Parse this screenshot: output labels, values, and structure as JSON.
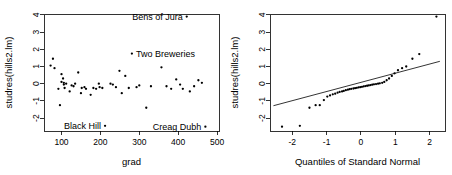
{
  "figure": {
    "background_color": "#ffffff",
    "point_color": "#000000",
    "line_color": "#000000"
  },
  "chart_data": [
    {
      "type": "scatter",
      "panel": "left",
      "title": "",
      "xlabel": "grad",
      "ylabel": "studres(hills2.lm)",
      "xlim": [
        55,
        505
      ],
      "ylim": [
        -2.75,
        4.05
      ],
      "xticks": [
        100,
        200,
        300,
        400,
        500
      ],
      "yticks": [
        -2,
        -1,
        0,
        1,
        2,
        3,
        4
      ],
      "grid": false,
      "legend": "none",
      "x": [
        72,
        78,
        82,
        92,
        96,
        100,
        100,
        104,
        106,
        106,
        108,
        112,
        121,
        126,
        131,
        135,
        143,
        150,
        152,
        159,
        163,
        175,
        182,
        189,
        196,
        198,
        205,
        212,
        226,
        232,
        240,
        249,
        255,
        264,
        273,
        281,
        293,
        300,
        318,
        330,
        357,
        370,
        382,
        395,
        405,
        412,
        422,
        430,
        441,
        452,
        461,
        470
      ],
      "y": [
        1.05,
        1.45,
        0.9,
        -0.3,
        -1.25,
        0.55,
        0.1,
        0.3,
        0.05,
        -0.05,
        -0.25,
        0.0,
        -0.45,
        -0.1,
        -0.15,
        0.0,
        0.65,
        -0.55,
        -0.25,
        -0.2,
        -0.3,
        -0.65,
        -0.25,
        -0.3,
        0.0,
        -0.2,
        -0.25,
        -2.45,
        0.0,
        -0.05,
        -0.2,
        0.75,
        -0.55,
        0.45,
        -0.25,
        1.75,
        -0.2,
        -0.1,
        -1.4,
        -0.15,
        0.95,
        -0.15,
        -0.3,
        0.25,
        -0.05,
        -0.3,
        3.9,
        -0.45,
        -0.15,
        0.2,
        0.05,
        -2.5
      ],
      "annotations": [
        {
          "text": "Bens of Jura",
          "x": 422,
          "y": 3.9,
          "position": "left"
        },
        {
          "text": "Two Breweries",
          "x": 281,
          "y": 1.75,
          "position": "right"
        },
        {
          "text": "Black Hill",
          "x": 212,
          "y": -2.45,
          "position": "left"
        },
        {
          "text": "Creag Dubh",
          "x": 470,
          "y": -2.5,
          "position": "left"
        }
      ]
    },
    {
      "type": "scatter",
      "panel": "right",
      "title": "",
      "xlabel": "Quantiles of Standard Normal",
      "ylabel": "studres(hills2.lm)",
      "xlim": [
        -2.65,
        2.45
      ],
      "ylim": [
        -2.75,
        4.05
      ],
      "xticks": [
        -2,
        -1,
        0,
        1,
        2
      ],
      "yticks": [
        -2,
        -1,
        0,
        1,
        2,
        3,
        4
      ],
      "grid": false,
      "legend": "none",
      "reference_line": {
        "x1": -2.55,
        "y1": -1.28,
        "x2": 2.3,
        "y2": 1.3
      },
      "x": [
        -2.3,
        -1.78,
        -1.5,
        -1.32,
        -1.2,
        -1.08,
        -0.98,
        -0.9,
        -0.82,
        -0.75,
        -0.68,
        -0.62,
        -0.55,
        -0.5,
        -0.44,
        -0.38,
        -0.33,
        -0.28,
        -0.22,
        -0.17,
        -0.12,
        -0.07,
        -0.02,
        0.03,
        0.08,
        0.13,
        0.18,
        0.23,
        0.28,
        0.33,
        0.38,
        0.44,
        0.5,
        0.55,
        0.62,
        0.68,
        0.75,
        0.82,
        0.9,
        0.98,
        1.08,
        1.2,
        1.32,
        1.5,
        1.7,
        2.2
      ],
      "y": [
        -2.5,
        -2.45,
        -1.4,
        -1.25,
        -1.25,
        -0.95,
        -0.75,
        -0.68,
        -0.62,
        -0.58,
        -0.52,
        -0.48,
        -0.45,
        -0.42,
        -0.38,
        -0.35,
        -0.32,
        -0.3,
        -0.28,
        -0.26,
        -0.24,
        -0.22,
        -0.2,
        -0.18,
        -0.16,
        -0.14,
        -0.12,
        -0.1,
        -0.08,
        -0.06,
        -0.04,
        -0.02,
        0.0,
        0.02,
        0.05,
        0.1,
        0.2,
        0.3,
        0.45,
        0.6,
        0.78,
        0.9,
        1.0,
        1.45,
        1.72,
        3.9
      ]
    }
  ]
}
